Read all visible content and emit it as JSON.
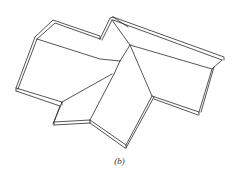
{
  "figure": {
    "caption": "(b)",
    "line_color": "#2a2a2a",
    "background": "#ffffff",
    "polylines": [
      {
        "name": "top-left-lip-outer",
        "points": "35,37 53,20 100,36 100,39"
      },
      {
        "name": "top-left-lip-inner",
        "points": "37,39 55,23 100,39"
      },
      {
        "name": "top-left-fold",
        "points": "37,39 100,59 120,61"
      },
      {
        "name": "left-wall-outer",
        "points": "35,37 16,88 16,91"
      },
      {
        "name": "left-wall-inner",
        "points": "37,39 18,89"
      },
      {
        "name": "left-bottom-lip",
        "points": "16,88 62,102 62,105"
      },
      {
        "name": "left-bottom-lip-inner",
        "points": "16,91 60,106"
      },
      {
        "name": "left-valley",
        "points": "62,102 112,74"
      },
      {
        "name": "left-step",
        "points": "62,102 54,122 54,125"
      },
      {
        "name": "left-step-inner",
        "points": "60,106 53,124"
      },
      {
        "name": "bottom-lip",
        "points": "54,122 90,120 90,123"
      },
      {
        "name": "bottom-lip-inner",
        "points": "54,125 90,123"
      },
      {
        "name": "center-valley",
        "points": "90,120 114,74"
      },
      {
        "name": "bottom-right-lip",
        "points": "90,120 126,145 126,148"
      },
      {
        "name": "bottom-right-lip-inner",
        "points": "90,123 125,148"
      },
      {
        "name": "right-ridge-lower",
        "points": "126,145 152,96"
      },
      {
        "name": "right-ridge-lower-inner",
        "points": "126,148 154,97"
      },
      {
        "name": "center-apex-outer",
        "points": "100,39 110,18 113,17"
      },
      {
        "name": "center-apex-inner",
        "points": "102,40 112,20"
      },
      {
        "name": "apex-fold-left",
        "points": "112,20 130,45 120,61"
      },
      {
        "name": "apex-fold-right",
        "points": "113,17 128,27"
      },
      {
        "name": "center-diagonal",
        "points": "120,61 114,74"
      },
      {
        "name": "center-ridge",
        "points": "130,45 152,96"
      },
      {
        "name": "top-right-lip-outer",
        "points": "113,17 224,57 224,60"
      },
      {
        "name": "top-right-lip-inner",
        "points": "113,20 222,60"
      },
      {
        "name": "top-right-fold",
        "points": "130,45 212,69 222,60"
      },
      {
        "name": "right-wall-outer",
        "points": "212,69 199,112"
      },
      {
        "name": "right-wall-inner",
        "points": "214,67 201,112"
      },
      {
        "name": "right-bottom-lip",
        "points": "152,96 199,112 199,115"
      },
      {
        "name": "right-bottom-lip-inner",
        "points": "154,99 198,115"
      }
    ]
  }
}
